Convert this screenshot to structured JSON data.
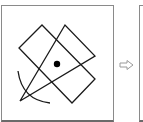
{
  "figure": {
    "panels": [
      {
        "id": "left",
        "description": "geometry construction: square, triangle sector, arc and center dot"
      },
      {
        "id": "right",
        "description": "next panel (cropped)"
      }
    ],
    "arrow": {
      "direction": "right",
      "style": "outline"
    },
    "shapes": {
      "square": [
        [
          42,
          25
        ],
        [
          95,
          79
        ],
        [
          72,
          103
        ],
        [
          19,
          48
        ]
      ],
      "sector": {
        "apex": [
          20,
          101
        ],
        "ends": [
          [
            65,
            25
          ],
          [
            95,
            56
          ]
        ]
      },
      "arc": {
        "center": [
          20,
          101
        ],
        "radius": 30,
        "from_deg": -95,
        "to_deg": 5
      },
      "dot": {
        "center": [
          57,
          64
        ],
        "radius": 3.2
      }
    },
    "colors": {
      "stroke": "#1a1a1a",
      "frame": "#8a8a8a",
      "arrow": "#9a9a9a"
    }
  }
}
